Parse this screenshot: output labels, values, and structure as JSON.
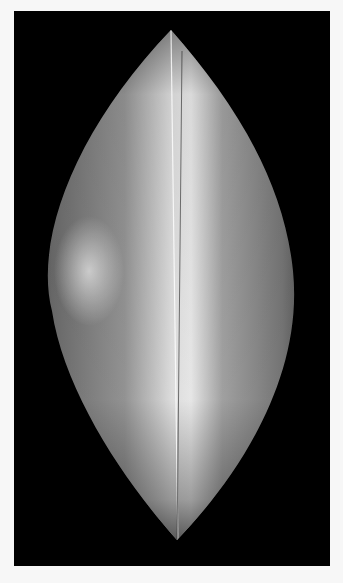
{
  "image": {
    "type": "grayscale radiograph (mammogram-like)",
    "background_color": "#f7f7f7",
    "frame_color": "#000000",
    "tissue_shape": "lens / vesica (pointed top and bottom)",
    "features": [
      "central bright vertical band",
      "thin vertical line artifacts",
      "brighter dense region on left mid",
      "dark vertical line near bottom"
    ]
  }
}
